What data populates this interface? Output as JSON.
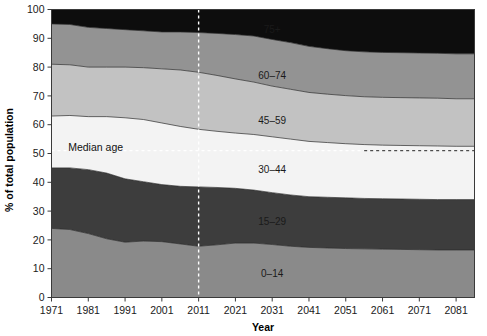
{
  "chart_data": {
    "type": "area",
    "stacked": true,
    "title": "",
    "xlabel": "Year",
    "ylabel": "% of total population",
    "xlim": [
      1971,
      2086
    ],
    "ylim": [
      0,
      100
    ],
    "grid": false,
    "legend_position": "inline-labels",
    "xticks": [
      1971,
      1981,
      1991,
      2001,
      2011,
      2021,
      2031,
      2041,
      2051,
      2061,
      2071,
      2081
    ],
    "xtick_labels": [
      "1971",
      "1981",
      "1991",
      "2001",
      "2011",
      "2021",
      "2031",
      "2041",
      "2051",
      "2061",
      "2071",
      "2081"
    ],
    "yticks": [
      0,
      10,
      20,
      30,
      40,
      50,
      60,
      70,
      80,
      90,
      100
    ],
    "ytick_labels": [
      "0",
      "10",
      "20",
      "30",
      "40",
      "50",
      "60",
      "70",
      "80",
      "90",
      "100"
    ],
    "x": [
      1971,
      1976,
      1981,
      1986,
      1991,
      1996,
      2001,
      2006,
      2011,
      2016,
      2021,
      2026,
      2031,
      2036,
      2041,
      2046,
      2051,
      2056,
      2061,
      2066,
      2071,
      2076,
      2081,
      2086
    ],
    "series": [
      {
        "name": "0-14",
        "label": "0–14",
        "color": "#8a8a8a",
        "label_color": "#1a1a1a",
        "label_x": 2031,
        "label_y": 8.5,
        "values": [
          24.0,
          23.6,
          22.2,
          20.4,
          19.2,
          19.6,
          19.4,
          18.6,
          17.8,
          18.3,
          18.9,
          18.9,
          18.4,
          17.8,
          17.4,
          17.2,
          17.0,
          16.9,
          16.8,
          16.7,
          16.6,
          16.5,
          16.5,
          16.5
        ]
      },
      {
        "name": "15-29",
        "label": "15–29",
        "color": "#3d3d3d",
        "label_color": "#ffffff",
        "label_x": 2031,
        "label_y": 26.5,
        "values": [
          21.0,
          21.4,
          22.2,
          22.8,
          22.0,
          20.6,
          19.8,
          20.0,
          20.6,
          19.9,
          19.0,
          18.4,
          18.0,
          17.8,
          17.6,
          17.6,
          17.6,
          17.5,
          17.5,
          17.5,
          17.5,
          17.5,
          17.5,
          17.5
        ]
      },
      {
        "name": "30-44",
        "label": "30–44",
        "color": "#f3f3f3",
        "label_color": "#1a1a1a",
        "label_x": 2031,
        "label_y": 44.5,
        "values": [
          18.0,
          18.2,
          18.4,
          19.6,
          21.2,
          21.6,
          21.4,
          20.8,
          20.0,
          19.5,
          19.2,
          19.3,
          19.4,
          19.4,
          19.2,
          19.0,
          18.8,
          18.7,
          18.6,
          18.6,
          18.6,
          18.6,
          18.5,
          18.5
        ]
      },
      {
        "name": "45-59",
        "label": "45–59",
        "color": "#c2c2c2",
        "label_color": "#1a1a1a",
        "label_x": 2031,
        "label_y": 61.5,
        "values": [
          18.0,
          17.6,
          17.2,
          17.2,
          17.6,
          18.0,
          18.8,
          19.6,
          19.8,
          19.4,
          18.8,
          18.2,
          17.6,
          17.3,
          17.0,
          16.8,
          16.7,
          16.6,
          16.6,
          16.6,
          16.6,
          16.6,
          16.5,
          16.5
        ]
      },
      {
        "name": "60-74",
        "label": "60–74",
        "color": "#939393",
        "label_color": "#ffffff",
        "label_x": 2031,
        "label_y": 77.0,
        "values": [
          14.0,
          14.0,
          13.8,
          13.4,
          13.0,
          12.8,
          12.8,
          13.2,
          13.8,
          14.6,
          15.4,
          16.0,
          16.2,
          16.2,
          16.0,
          15.8,
          15.6,
          15.6,
          15.6,
          15.6,
          15.6,
          15.6,
          15.6,
          15.6
        ]
      },
      {
        "name": "75+",
        "label": "75+",
        "color": "#0d0d0d",
        "label_color": "#ffffff",
        "label_x": 2031,
        "label_y": 93.0,
        "values": [
          5.0,
          5.2,
          6.2,
          6.6,
          7.0,
          7.4,
          7.8,
          7.8,
          8.0,
          8.3,
          8.7,
          9.2,
          10.4,
          11.5,
          12.8,
          13.6,
          14.3,
          14.7,
          14.9,
          15.0,
          15.1,
          15.2,
          15.4,
          15.4
        ]
      }
    ],
    "annotations": [
      {
        "name": "median-age",
        "text": "Median age",
        "x": 1983,
        "y": 52.0,
        "type": "text"
      }
    ],
    "marker_lines": [
      {
        "name": "year-2011-marker",
        "orientation": "vertical",
        "value": 2011,
        "style": "dashed",
        "color": "#ffffff"
      },
      {
        "name": "median-age-line",
        "orientation": "horizontal",
        "value": 51.0,
        "x_start": 1971,
        "x_end": 2086,
        "style": "dashed",
        "color": "#ffffff"
      }
    ]
  },
  "axes": {
    "y_title": "% of total population",
    "x_title": "Year"
  }
}
